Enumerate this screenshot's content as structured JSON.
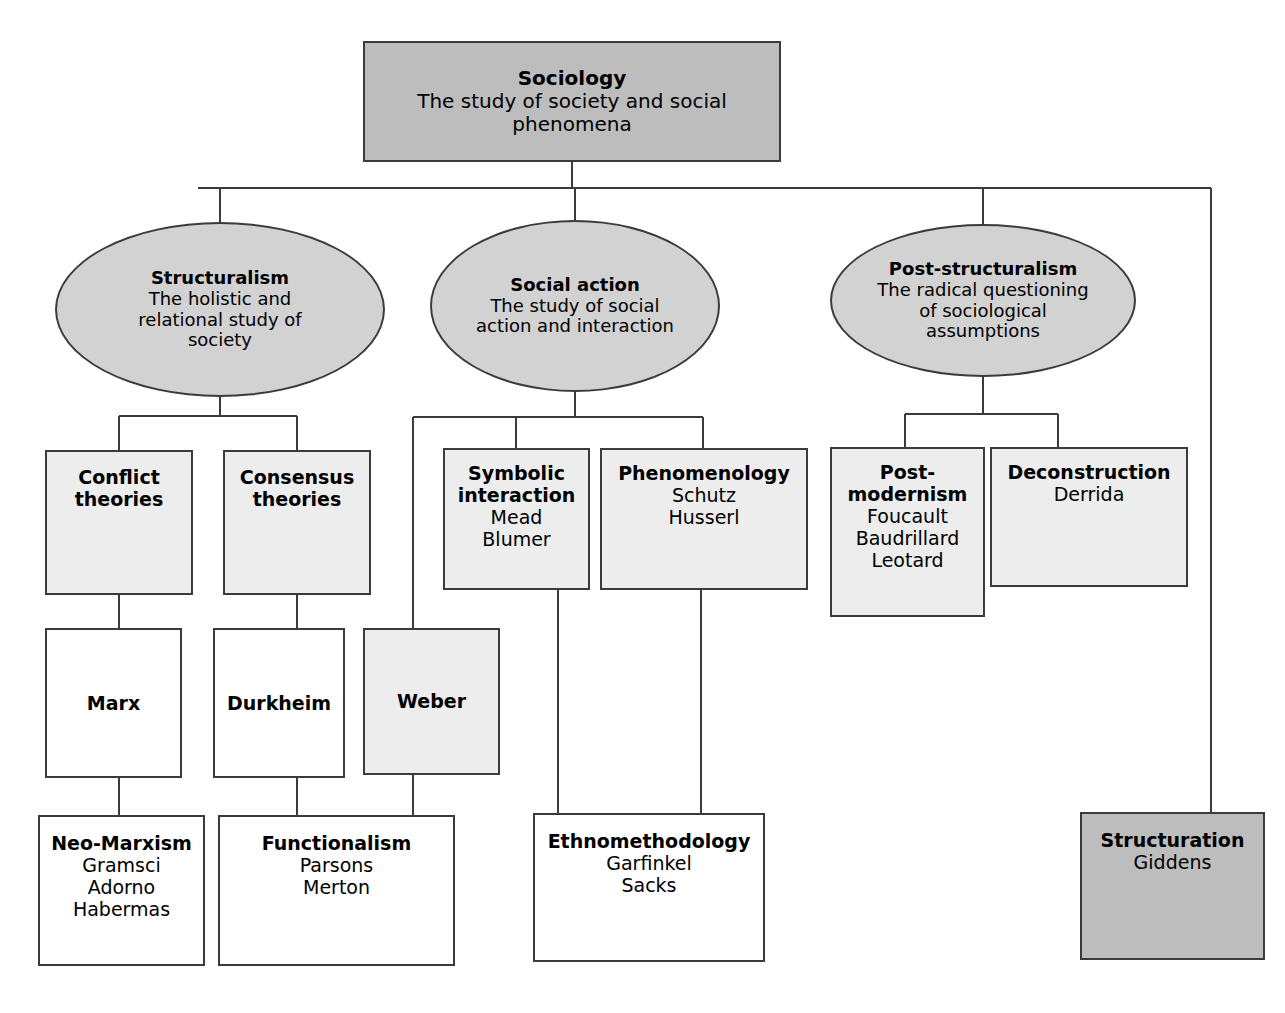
{
  "diagram": {
    "colors": {
      "root_fill": "#bdbdbd",
      "ellipse_fill": "#d2d2d2",
      "light_fill": "#ededed",
      "white_fill": "#ffffff",
      "stroke": "#3b3b3b",
      "text": "#000000",
      "background": "#ffffff"
    }
  },
  "root": {
    "title": "Sociology",
    "sub_line_1": "The study of society and social",
    "sub_line_2": "phenomena"
  },
  "branches": [
    {
      "title": "Structuralism",
      "sub_line_1": "The holistic and",
      "sub_line_2": "relational study of",
      "sub_line_3": "society"
    },
    {
      "title": "Social action",
      "sub_line_1": "The study of social",
      "sub_line_2": "action and interaction",
      "sub_line_3": ""
    },
    {
      "title": "Post-structuralism",
      "sub_line_1": "The radical questioning",
      "sub_line_2": "of sociological",
      "sub_line_3": "assumptions"
    }
  ],
  "nodes": {
    "conflict": {
      "title_line_1": "Conflict",
      "title_line_2": "theories"
    },
    "consensus": {
      "title_line_1": "Consensus",
      "title_line_2": "theories"
    },
    "symbolic": {
      "title_line_1": "Symbolic",
      "title_line_2": "interaction",
      "sub_line_1": "Mead",
      "sub_line_2": "Blumer"
    },
    "phenomenology": {
      "title": "Phenomenology",
      "sub_line_1": "Schutz",
      "sub_line_2": "Husserl"
    },
    "postmodernism": {
      "title_line_1": "Post-",
      "title_line_2": "modernism",
      "sub_line_1": "Foucault",
      "sub_line_2": "Baudrillard",
      "sub_line_3": "Leotard"
    },
    "deconstruction": {
      "title": "Deconstruction",
      "sub_line_1": "Derrida"
    },
    "marx": {
      "title": "Marx"
    },
    "durkheim": {
      "title": "Durkheim"
    },
    "weber": {
      "title": "Weber"
    },
    "neomarxism": {
      "title": "Neo-Marxism",
      "sub_line_1": "Gramsci",
      "sub_line_2": "Adorno",
      "sub_line_3": "Habermas"
    },
    "functionalism": {
      "title": "Functionalism",
      "sub_line_1": "Parsons",
      "sub_line_2": "Merton"
    },
    "ethnomethodology": {
      "title": "Ethnomethodology",
      "sub_line_1": "Garfinkel",
      "sub_line_2": "Sacks"
    },
    "structuration": {
      "title": "Structuration",
      "sub_line_1": "Giddens"
    }
  }
}
